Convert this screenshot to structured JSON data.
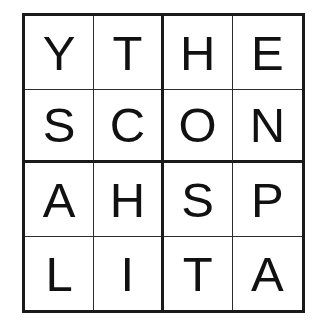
{
  "puzzle": {
    "title": "4x4 letter grid",
    "rows": 4,
    "columns": 4,
    "background_color": "#ffffff",
    "letter_color": "#111111",
    "line_color": "#1a1a1a",
    "thin_line_color": "#2b2b2b",
    "grid": [
      [
        "Y",
        "T",
        "H",
        "E"
      ],
      [
        "S",
        "C",
        "O",
        "N"
      ],
      [
        "A",
        "H",
        "S",
        "P"
      ],
      [
        "L",
        "I",
        "T",
        "A"
      ]
    ],
    "row_strings": [
      "YTHE",
      "SCON",
      "AHSP",
      "LITA"
    ],
    "column_strings": [
      "YSAL",
      "TCHI",
      "HOST",
      "ENPA"
    ],
    "cells": [
      {
        "id": "r1c1",
        "letter": "Y",
        "row": 1,
        "col": 1
      },
      {
        "id": "r1c2",
        "letter": "T",
        "row": 1,
        "col": 2
      },
      {
        "id": "r1c3",
        "letter": "H",
        "row": 1,
        "col": 3
      },
      {
        "id": "r1c4",
        "letter": "E",
        "row": 1,
        "col": 4
      },
      {
        "id": "r2c1",
        "letter": "S",
        "row": 2,
        "col": 1
      },
      {
        "id": "r2c2",
        "letter": "C",
        "row": 2,
        "col": 2
      },
      {
        "id": "r2c3",
        "letter": "O",
        "row": 2,
        "col": 3
      },
      {
        "id": "r2c4",
        "letter": "N",
        "row": 2,
        "col": 4
      },
      {
        "id": "r3c1",
        "letter": "A",
        "row": 3,
        "col": 1
      },
      {
        "id": "r3c2",
        "letter": "H",
        "row": 3,
        "col": 2
      },
      {
        "id": "r3c3",
        "letter": "S",
        "row": 3,
        "col": 3
      },
      {
        "id": "r3c4",
        "letter": "P",
        "row": 3,
        "col": 4
      },
      {
        "id": "r4c1",
        "letter": "L",
        "row": 4,
        "col": 1
      },
      {
        "id": "r4c2",
        "letter": "I",
        "row": 4,
        "col": 2
      },
      {
        "id": "r4c3",
        "letter": "T",
        "row": 4,
        "col": 3
      },
      {
        "id": "r4c4",
        "letter": "A",
        "row": 4,
        "col": 4
      }
    ]
  }
}
